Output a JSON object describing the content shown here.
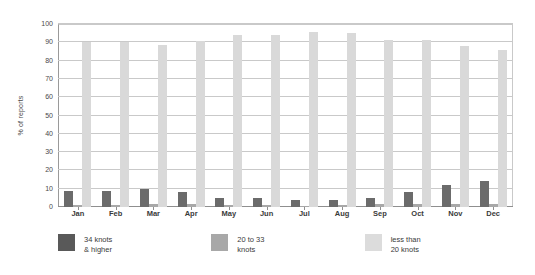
{
  "chart_data": {
    "type": "bar",
    "title": "",
    "subtitle": "",
    "xlabel": "",
    "ylabel": "% of reports",
    "ylim": [
      0,
      100
    ],
    "ytick_step": 10,
    "yticks": [
      0,
      10,
      20,
      30,
      40,
      50,
      60,
      70,
      80,
      90,
      100
    ],
    "grid": true,
    "legend_position": "bottom",
    "categories": [
      "Jan",
      "Feb",
      "Mar",
      "Apr",
      "May",
      "Jun",
      "Jul",
      "Aug",
      "Sep",
      "Oct",
      "Nov",
      "Dec"
    ],
    "series": [
      {
        "name": "34 knots & higher",
        "name_line1": "34 knots",
        "name_line2": "& higher",
        "color": "#6b6b6b",
        "swatch_color": "#595959",
        "values": [
          9,
          9,
          10,
          8,
          5,
          5,
          4,
          4,
          5,
          8,
          12,
          14
        ]
      },
      {
        "name": "20 to 33 knots",
        "name_line1": "20 to 33",
        "name_line2": "knots",
        "color": "#a8a8a8",
        "swatch_color": "#a8a8a8",
        "values": [
          1,
          1,
          1.5,
          1.5,
          1,
          1,
          0.5,
          1,
          1.5,
          1.5,
          1.5,
          1.5
        ]
      },
      {
        "name": "less than 20 knots",
        "name_line1": "less than",
        "name_line2": "20 knots",
        "color": "#d9d9d9",
        "swatch_color": "#dcdcdc",
        "values": [
          90,
          90,
          88.5,
          90.5,
          94,
          94,
          95.5,
          95,
          91,
          91,
          88,
          86
        ]
      }
    ]
  }
}
